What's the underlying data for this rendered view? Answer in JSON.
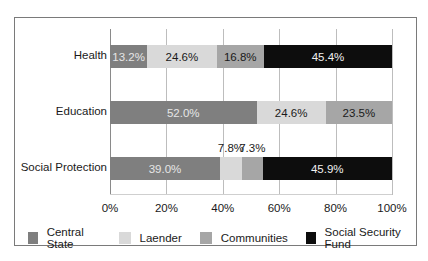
{
  "chart_data": {
    "type": "bar",
    "orientation": "horizontal",
    "stacked": "percent",
    "title": "",
    "xlabel": "",
    "ylabel": "",
    "xlim": [
      0,
      100
    ],
    "grid": true,
    "legend_position": "bottom",
    "categories": [
      "Health",
      "Education",
      "Social Protection"
    ],
    "series": [
      {
        "name": "Central State",
        "color": "#7f7f7f",
        "values": [
          13.2,
          52.0,
          39.0
        ],
        "labels": [
          "13.2%",
          "52.0%",
          "39.0%"
        ]
      },
      {
        "name": "Laender",
        "color": "#d9d9d9",
        "values": [
          24.6,
          24.6,
          7.8
        ],
        "labels": [
          "24.6%",
          "24.6%",
          "7.8%"
        ]
      },
      {
        "name": "Communities",
        "color": "#a6a6a6",
        "values": [
          16.8,
          23.5,
          7.3
        ],
        "labels": [
          "16.8%",
          "23.5%",
          "7.3%"
        ]
      },
      {
        "name": "Social Security Fund",
        "color": "#0d0d0d",
        "values": [
          45.4,
          0.0,
          45.9
        ],
        "labels": [
          "45.4%",
          "",
          "45.9%"
        ]
      }
    ],
    "x_ticks": [
      "0%",
      "20%",
      "40%",
      "60%",
      "80%",
      "100%"
    ]
  },
  "legend": {
    "items": [
      {
        "label": "Central State",
        "color": "#7f7f7f"
      },
      {
        "label": "Laender",
        "color": "#d9d9d9"
      },
      {
        "label": "Communities",
        "color": "#a6a6a6"
      },
      {
        "label": "Social Security Fund",
        "color": "#0d0d0d"
      }
    ]
  }
}
